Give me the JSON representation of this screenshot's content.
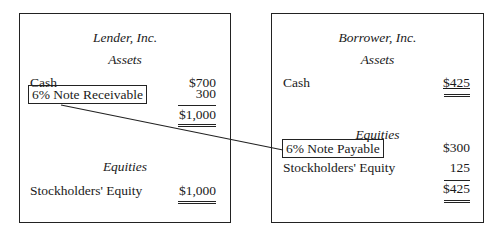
{
  "lender": {
    "company": "Lender, Inc.",
    "assets_heading": "Assets",
    "assets": [
      {
        "label": "Cash",
        "amount": "$700"
      },
      {
        "label": "6% Note Receivable",
        "amount": "300"
      }
    ],
    "assets_total": "$1,000",
    "equities_heading": "Equities",
    "equities": [
      {
        "label": "Stockholders' Equity",
        "amount": "$1,000"
      }
    ]
  },
  "borrower": {
    "company": "Borrower, Inc.",
    "assets_heading": "Assets",
    "assets": [
      {
        "label": "Cash",
        "amount": "$425"
      }
    ],
    "equities_heading": "Equities",
    "equities": [
      {
        "label": "6% Note Payable",
        "amount": "$300"
      },
      {
        "label": "Stockholders' Equity",
        "amount": "125"
      }
    ],
    "equities_total": "$425"
  }
}
